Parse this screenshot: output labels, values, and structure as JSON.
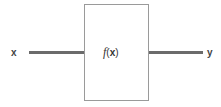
{
  "diagram": {
    "type": "function-block",
    "input_label": "x",
    "output_label": "y",
    "block": {
      "function_name": "f",
      "open_paren": "(",
      "argument": "x",
      "close_paren": ")"
    },
    "colors": {
      "wire": "#6b6b6b",
      "box_border": "#9a9a9a",
      "text": "#444444"
    }
  }
}
